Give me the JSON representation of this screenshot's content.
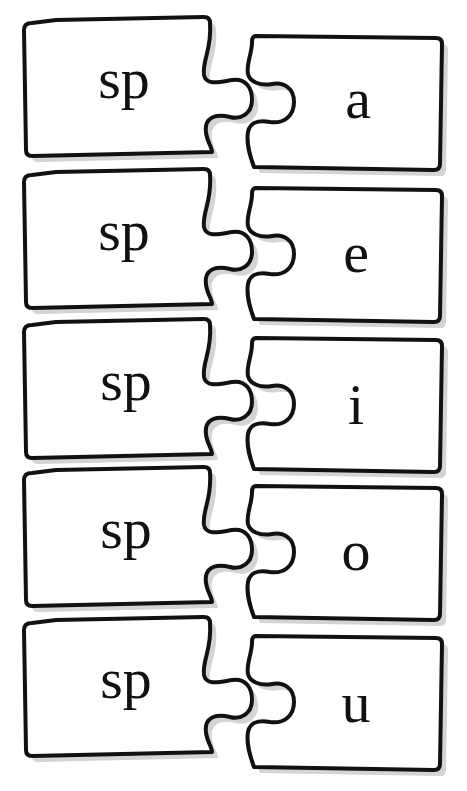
{
  "worksheet": {
    "title": "sp blends puzzle",
    "rows": [
      {
        "left": "sp",
        "right": "a"
      },
      {
        "left": "sp",
        "right": "e"
      },
      {
        "left": "sp",
        "right": "i"
      },
      {
        "left": "sp",
        "right": "o"
      },
      {
        "left": "sp",
        "right": "u"
      }
    ]
  },
  "style": {
    "stroke": "#111111",
    "fill": "#ffffff",
    "shadow": "#d4d4d4",
    "background": "#ffffff"
  }
}
